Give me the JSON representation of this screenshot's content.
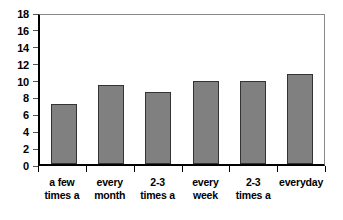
{
  "chart_data": {
    "type": "bar",
    "title": "",
    "subtitle": "",
    "xlabel": "",
    "ylabel": "",
    "categories": [
      "a few times a",
      "every month",
      "2-3 times a",
      "every week",
      "2-3 times a",
      "everyday"
    ],
    "category_lines": [
      [
        "a few",
        "times a"
      ],
      [
        "every",
        "month"
      ],
      [
        "2-3",
        "times a"
      ],
      [
        "every",
        "week"
      ],
      [
        "2-3",
        "times a"
      ],
      [
        "everyday"
      ]
    ],
    "values": [
      7.1,
      9.3,
      8.5,
      9.8,
      9.8,
      10.7
    ],
    "ylim": [
      0,
      18
    ],
    "ytick_labels": [
      "18",
      "16",
      "14",
      "12",
      "10",
      "8",
      "6",
      "4",
      "2",
      "0"
    ],
    "ytick_values": [
      18,
      16,
      14,
      12,
      10,
      8,
      6,
      4,
      2,
      0
    ],
    "ytick_step": 2,
    "grid": false,
    "legend": false,
    "legend_position": "none",
    "bar_color": "#808080",
    "bar_border_color": "#333333",
    "axis_color": "#000000",
    "plot_border_color": "#888888",
    "background_color": "#ffffff"
  }
}
